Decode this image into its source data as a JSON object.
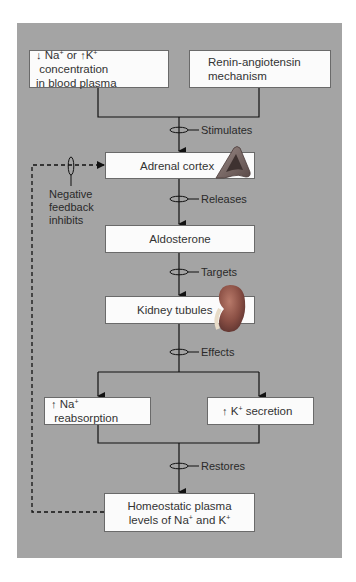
{
  "diagram": {
    "panel_color": "#a4a4a4",
    "inputs": [
      {
        "id": "ion-change",
        "prefix_down": "↓",
        "na": "Na",
        "na_sup": "+",
        "mid": " or ",
        "prefix_up": "↑",
        "k": "K",
        "k_sup": "+",
        "rest_line1": " concentration",
        "line2": "in blood plasma"
      },
      {
        "id": "renin",
        "line1": "Renin-angiotensin",
        "line2": "mechanism"
      }
    ],
    "relations": {
      "stimulates": "Stimulates",
      "releases": "Releases",
      "targets": "Targets",
      "effects": "Effects",
      "restores": "Restores"
    },
    "nodes": {
      "adrenal": "Adrenal cortex",
      "aldosterone": "Aldosterone",
      "kidney": "Kidney tubules",
      "na_reabs": {
        "arrow": "↑",
        "ion": "Na",
        "sup": "+",
        "text": " reabsorption"
      },
      "k_secr": {
        "arrow": "↑",
        "ion": "K",
        "sup": "+",
        "text": " secretion"
      },
      "homeostatic": {
        "line1": "Homeostatic plasma",
        "line2_a": "levels of Na",
        "sup1": "+",
        "line2_b": " and K",
        "sup2": "+"
      }
    },
    "feedback": {
      "line1": "Negative",
      "line2": "feedback",
      "line3": "inhibits"
    },
    "icons": {
      "adrenal": "adrenal-gland-illustration",
      "kidney": "kidney-illustration"
    }
  }
}
